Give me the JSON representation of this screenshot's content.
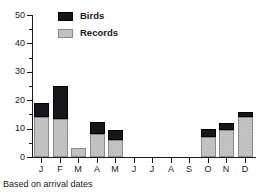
{
  "chart_data": {
    "type": "bar",
    "stacked": true,
    "title": "",
    "subtitle": "",
    "xlabel": "",
    "ylabel": "",
    "categories": [
      "J",
      "F",
      "M",
      "A",
      "M",
      "J",
      "J",
      "A",
      "S",
      "O",
      "N",
      "D"
    ],
    "series": [
      {
        "name": "Records",
        "color": "#c9c9c9",
        "values": [
          14,
          13.5,
          3,
          8,
          6,
          0,
          0,
          0,
          0,
          7,
          9.5,
          14
        ]
      },
      {
        "name": "Birds",
        "color": "#17171a",
        "values": [
          5,
          11.5,
          0,
          4.3,
          3.5,
          0,
          0,
          0,
          0,
          3,
          2.5,
          2
        ]
      }
    ],
    "totals": [
      19,
      25,
      3,
      12.3,
      9.5,
      0,
      0,
      0,
      0,
      10,
      12,
      16
    ],
    "ylim": [
      0,
      50
    ],
    "yticks": [
      0,
      10,
      20,
      30,
      40,
      50
    ],
    "ytick_labels": [
      "0",
      "10",
      "20",
      "30",
      "40",
      "50"
    ],
    "yticks_minor": [
      5,
      15,
      25,
      35,
      45
    ],
    "grid": false,
    "legend_position": "top-left",
    "annotation": "Based on arrival dates"
  },
  "legend": {
    "items": [
      {
        "label": "Birds",
        "swatch": "birds"
      },
      {
        "label": "Records",
        "swatch": "records"
      }
    ]
  },
  "caption": {
    "text": "Based on arrival dates"
  }
}
